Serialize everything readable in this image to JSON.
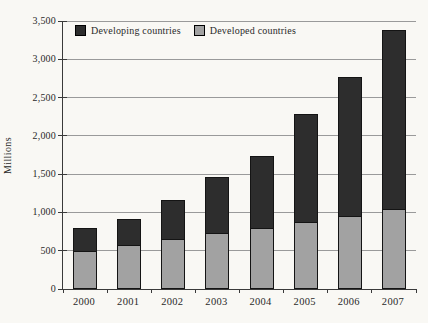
{
  "chart_data": {
    "type": "bar",
    "stacked": true,
    "title": "",
    "categories": [
      "2000",
      "2001",
      "2002",
      "2003",
      "2004",
      "2005",
      "2006",
      "2007"
    ],
    "series": [
      {
        "name": "Developing countries",
        "color": "#2d2d2d",
        "values": [
          300,
          350,
          510,
          730,
          940,
          1410,
          1810,
          2340
        ]
      },
      {
        "name": "Developed countries",
        "color": "#a2a2a2",
        "values": [
          500,
          570,
          650,
          730,
          800,
          870,
          960,
          1040
        ]
      }
    ],
    "stack_bottom_series": "Developed countries",
    "totals": [
      800,
      920,
      1160,
      1460,
      1740,
      2280,
      2770,
      3380
    ],
    "xlabel": "",
    "ylabel": "Millions",
    "ylim": [
      0,
      3500
    ],
    "y_ticks": [
      {
        "value": 0,
        "label": "0"
      },
      {
        "value": 500,
        "label": "500"
      },
      {
        "value": 1000,
        "label": "1,000"
      },
      {
        "value": 1500,
        "label": "1,500"
      },
      {
        "value": 2000,
        "label": "2,000"
      },
      {
        "value": 2500,
        "label": "2,500"
      },
      {
        "value": 3000,
        "label": "3,000"
      },
      {
        "value": 3500,
        "label": "3,500"
      }
    ],
    "grid": "horizontal",
    "legend_position": "top-left-inside",
    "colors": {
      "background": "#f9f8f4",
      "grid": "#9a9a9a",
      "axis": "#3a3a3a",
      "text": "#2a2a2a",
      "bar_border": "#141414"
    }
  }
}
